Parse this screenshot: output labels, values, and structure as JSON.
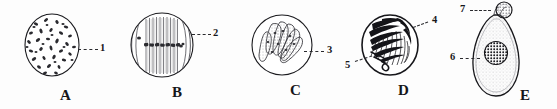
{
  "figure": {
    "width": 557,
    "height": 109,
    "background_color": "#fdfdfd",
    "ink_color": "#1a1a1e"
  },
  "panels": [
    {
      "letter": "A",
      "name": "panel-a",
      "shape": "oval cell filled with many scattered small chromosome dots",
      "callouts": [
        {
          "number": "1",
          "leader": "dashed",
          "points_to": "right edge of cell interior"
        }
      ]
    },
    {
      "letter": "B",
      "name": "panel-b",
      "shape": "round cell with vertical spindle fibers and chromosomes aligned across the equator",
      "callouts": [
        {
          "number": "2",
          "leader": "dashed",
          "points_to": "right side spindle fiber"
        }
      ]
    },
    {
      "letter": "C",
      "name": "panel-c",
      "shape": "round cell containing a clustered fan of elongated rod-shaped chromosomes",
      "callouts": [
        {
          "number": "3",
          "leader": "dashed",
          "points_to": "chromosome cluster at cell centre"
        }
      ]
    },
    {
      "letter": "D",
      "name": "panel-d",
      "shape": "oval cell with dense dark radiating condensed chromosomes",
      "callouts": [
        {
          "number": "4",
          "leader": "dashed",
          "points_to": "upper right dark chromosome mass"
        },
        {
          "number": "5",
          "leader": "dashed",
          "points_to": "lower left chromosome strands"
        }
      ]
    },
    {
      "letter": "E",
      "name": "panel-e",
      "shape": "pear shaped stippled cell with small round cap body on top and a dark round nucleus in the centre",
      "callouts": [
        {
          "number": "6",
          "leader": "dashed",
          "points_to": "cell body cytoplasm"
        },
        {
          "number": "7",
          "leader": "dashed",
          "points_to": "small round cap body at apex"
        }
      ]
    }
  ],
  "labels": {
    "a": "A",
    "b": "B",
    "c": "C",
    "d": "D",
    "e": "E",
    "n1": "1",
    "n2": "2",
    "n3": "3",
    "n4": "4",
    "n5": "5",
    "n6": "6",
    "n7": "7"
  }
}
